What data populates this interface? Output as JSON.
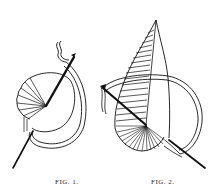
{
  "plate": {
    "background": "#ffffff",
    "ink_color": "#111111",
    "figures": [
      {
        "id": "fig1",
        "caption": "FIG. 1.",
        "depicts": "needle passing through fan of radiating stitches on circular outline with looping thread"
      },
      {
        "id": "fig2",
        "caption": "FIG. 2.",
        "depicts": "needle through tall pointed wedge of satin stitches above a fan of radiating stitches, thread looped around"
      }
    ]
  }
}
